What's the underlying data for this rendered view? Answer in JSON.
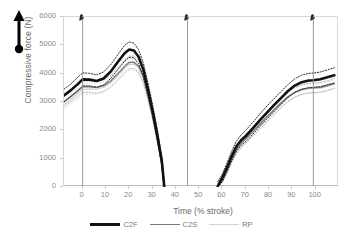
{
  "figure": {
    "annotation_icon": "up-arrow-icon"
  },
  "chart_data": {
    "type": "line",
    "title": "",
    "xlabel": "Time (% stroke)",
    "ylabel": "Compressive force (N)",
    "xlim": [
      -8,
      110
    ],
    "ylim": [
      0,
      6000
    ],
    "grid": false,
    "legend_position": "bottom",
    "xticks": [
      0,
      10,
      20,
      30,
      40,
      50,
      60,
      70,
      80,
      90,
      100
    ],
    "yticks": [
      0,
      1000,
      2000,
      3000,
      4000,
      5000,
      6000
    ],
    "event_lines": [
      {
        "label": "heel-strike-marker",
        "x": 0,
        "icon": "foot-marker-icon"
      },
      {
        "label": "toe-off-marker",
        "x": 45,
        "icon": "foot-marker-icon"
      },
      {
        "label": "cycle-end-marker",
        "x": 99,
        "icon": "foot-marker-icon"
      }
    ],
    "segments": [
      {
        "name": "push",
        "x_start": -8,
        "x_end": 35
      },
      {
        "name": "recovery",
        "x_start": 58,
        "x_end": 108
      }
    ],
    "series": [
      {
        "name": "C2F",
        "color": "#111111",
        "width": 2.6,
        "band": "dotted",
        "x": [
          -8,
          -5,
          -2,
          0,
          3,
          6,
          9,
          12,
          15,
          18,
          20,
          22,
          24,
          26,
          28,
          30,
          32,
          34,
          35,
          58,
          60,
          62,
          64,
          66,
          68,
          70,
          73,
          76,
          79,
          82,
          85,
          88,
          91,
          94,
          97,
          99,
          102,
          105,
          108
        ],
        "values": [
          3230,
          3420,
          3640,
          3800,
          3790,
          3740,
          3830,
          4070,
          4400,
          4720,
          4850,
          4820,
          4600,
          4150,
          3450,
          2700,
          1850,
          900,
          30,
          30,
          330,
          700,
          1100,
          1440,
          1650,
          1800,
          2070,
          2350,
          2620,
          2880,
          3130,
          3380,
          3580,
          3700,
          3760,
          3770,
          3800,
          3870,
          3940
        ],
        "band_upper": [
          3450,
          3640,
          3880,
          4030,
          4010,
          3960,
          4060,
          4310,
          4660,
          5000,
          5120,
          5080,
          4850,
          4390,
          3680,
          2910,
          2040,
          1060,
          190,
          190,
          470,
          860,
          1270,
          1620,
          1840,
          2000,
          2280,
          2570,
          2850,
          3110,
          3360,
          3610,
          3820,
          3950,
          4010,
          4020,
          4060,
          4130,
          4210
        ],
        "band_lower": [
          3010,
          3200,
          3400,
          3570,
          3570,
          3520,
          3600,
          3830,
          4140,
          4440,
          4580,
          4560,
          4350,
          3910,
          3220,
          2490,
          1660,
          740,
          0,
          0,
          190,
          540,
          930,
          1260,
          1460,
          1600,
          1860,
          2130,
          2390,
          2650,
          2900,
          3150,
          3340,
          3450,
          3510,
          3520,
          3540,
          3610,
          3670
        ]
      },
      {
        "name": "C2S",
        "color": "#7d7d7d",
        "width": 1.5,
        "band": "dotted",
        "x": [
          -8,
          -5,
          -2,
          0,
          3,
          6,
          9,
          12,
          15,
          18,
          20,
          22,
          24,
          26,
          28,
          30,
          32,
          34,
          35,
          58,
          60,
          62,
          64,
          66,
          68,
          70,
          73,
          76,
          79,
          82,
          85,
          88,
          91,
          94,
          97,
          99,
          102,
          105,
          108
        ],
        "values": [
          3000,
          3200,
          3400,
          3540,
          3540,
          3510,
          3580,
          3740,
          3990,
          4260,
          4400,
          4400,
          4270,
          3900,
          3280,
          2560,
          1730,
          830,
          10,
          10,
          300,
          640,
          1010,
          1330,
          1540,
          1700,
          1950,
          2210,
          2470,
          2720,
          2960,
          3180,
          3340,
          3440,
          3490,
          3500,
          3520,
          3580,
          3660
        ],
        "band_upper": [
          3190,
          3380,
          3600,
          3740,
          3740,
          3710,
          3780,
          3940,
          4200,
          4470,
          4620,
          4620,
          4480,
          4100,
          3460,
          2720,
          1870,
          960,
          130,
          130,
          420,
          770,
          1140,
          1470,
          1690,
          1850,
          2110,
          2380,
          2640,
          2890,
          3130,
          3350,
          3510,
          3610,
          3660,
          3670,
          3690,
          3750,
          3830
        ],
        "band_lower": [
          2810,
          3020,
          3200,
          3340,
          3340,
          3310,
          3380,
          3540,
          3780,
          4050,
          4180,
          4180,
          4060,
          3700,
          3100,
          2400,
          1590,
          700,
          0,
          0,
          180,
          510,
          880,
          1190,
          1390,
          1550,
          1790,
          2040,
          2300,
          2550,
          2790,
          3010,
          3170,
          3270,
          3320,
          3330,
          3350,
          3410,
          3490
        ]
      },
      {
        "name": "RP",
        "color": "#cfcfcf",
        "width": 1.2,
        "band": "dotted",
        "x": [
          -8,
          -5,
          -2,
          0,
          3,
          6,
          9,
          12,
          15,
          18,
          20,
          22,
          24,
          26,
          28,
          30,
          32,
          34,
          35,
          58,
          60,
          62,
          64,
          66,
          68,
          70,
          73,
          76,
          79,
          82,
          85,
          88,
          91,
          94,
          97,
          99,
          102,
          105,
          108
        ],
        "values": [
          2900,
          3100,
          3310,
          3450,
          3460,
          3450,
          3520,
          3680,
          3930,
          4190,
          4330,
          4340,
          4220,
          3860,
          3250,
          2540,
          1720,
          820,
          10,
          10,
          280,
          610,
          970,
          1290,
          1510,
          1680,
          1930,
          2190,
          2450,
          2700,
          2940,
          3160,
          3330,
          3430,
          3470,
          3480,
          3490,
          3550,
          3620
        ],
        "band_upper": [
          3080,
          3280,
          3500,
          3640,
          3650,
          3640,
          3710,
          3870,
          4130,
          4390,
          4540,
          4550,
          4420,
          4050,
          3420,
          2690,
          1850,
          940,
          120,
          120,
          390,
          730,
          1090,
          1420,
          1650,
          1820,
          2080,
          2350,
          2610,
          2860,
          3100,
          3320,
          3490,
          3590,
          3630,
          3640,
          3650,
          3710,
          3780
        ],
        "band_lower": [
          2720,
          2920,
          3120,
          3260,
          3270,
          3260,
          3330,
          3490,
          3730,
          3990,
          4120,
          4130,
          4020,
          3670,
          3080,
          2390,
          1590,
          700,
          0,
          0,
          170,
          490,
          850,
          1160,
          1370,
          1540,
          1780,
          2030,
          2290,
          2540,
          2780,
          3000,
          3170,
          3270,
          3310,
          3320,
          3330,
          3390,
          3460
        ]
      }
    ],
    "legend": [
      {
        "label": "C2F",
        "color": "#111111",
        "style": "thick-solid"
      },
      {
        "label": "C2S",
        "color": "#7d7d7d",
        "style": "medium-solid"
      },
      {
        "label": "RP",
        "color": "#cfcfcf",
        "style": "thin-solid"
      }
    ]
  }
}
